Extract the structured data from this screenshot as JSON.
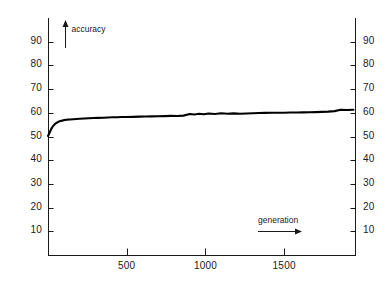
{
  "chart_data": {
    "type": "line",
    "title": "",
    "xlabel": "generation",
    "ylabel": "accuracy",
    "xlim": [
      0,
      1950
    ],
    "ylim": [
      0,
      100
    ],
    "grid": false,
    "legend": null,
    "xticks": [
      500,
      1000,
      1500
    ],
    "yticks": [
      10,
      20,
      30,
      40,
      50,
      60,
      70,
      80,
      90
    ],
    "ytick_labels_left": [
      "90",
      "80",
      "70",
      "60",
      "50",
      "40",
      "30",
      "20",
      "10"
    ],
    "ytick_labels_right": [
      "90",
      "80",
      "70",
      "60",
      "50",
      "40",
      "30",
      "20",
      "10"
    ],
    "xtick_labels": [
      "500",
      "1000",
      "1500"
    ],
    "annotations": [
      {
        "text": "accuracy",
        "arrow": "up"
      },
      {
        "text": "generation",
        "arrow": "right"
      }
    ],
    "series": [
      {
        "name": "accuracy",
        "color": "#000000",
        "x": [
          0,
          10,
          20,
          30,
          40,
          50,
          60,
          70,
          80,
          90,
          100,
          120,
          140,
          160,
          180,
          200,
          230,
          260,
          290,
          320,
          350,
          380,
          410,
          440,
          470,
          500,
          540,
          580,
          620,
          660,
          700,
          740,
          780,
          820,
          860,
          900,
          930,
          960,
          990,
          1020,
          1060,
          1100,
          1140,
          1180,
          1220,
          1260,
          1300,
          1340,
          1380,
          1420,
          1460,
          1500,
          1540,
          1580,
          1620,
          1660,
          1700,
          1740,
          1780,
          1820,
          1860,
          1900,
          1940
        ],
        "y": [
          50.2,
          51.6,
          53.1,
          54.2,
          55.0,
          55.6,
          56.0,
          56.3,
          56.5,
          56.7,
          56.9,
          57.1,
          57.2,
          57.3,
          57.4,
          57.5,
          57.6,
          57.7,
          57.8,
          57.85,
          57.9,
          58.0,
          58.1,
          58.15,
          58.2,
          58.25,
          58.3,
          58.4,
          58.45,
          58.5,
          58.55,
          58.6,
          58.7,
          58.65,
          58.8,
          59.5,
          59.3,
          59.6,
          59.4,
          59.7,
          59.5,
          59.8,
          59.6,
          59.75,
          59.6,
          59.7,
          59.8,
          59.9,
          59.95,
          60.0,
          60.0,
          60.05,
          60.1,
          60.15,
          60.2,
          60.25,
          60.3,
          60.4,
          60.5,
          60.7,
          61.3,
          61.2,
          61.3
        ]
      }
    ]
  },
  "plot": {
    "frame": {
      "left": 48,
      "right": 355,
      "top": 18,
      "bottom": 255
    }
  }
}
